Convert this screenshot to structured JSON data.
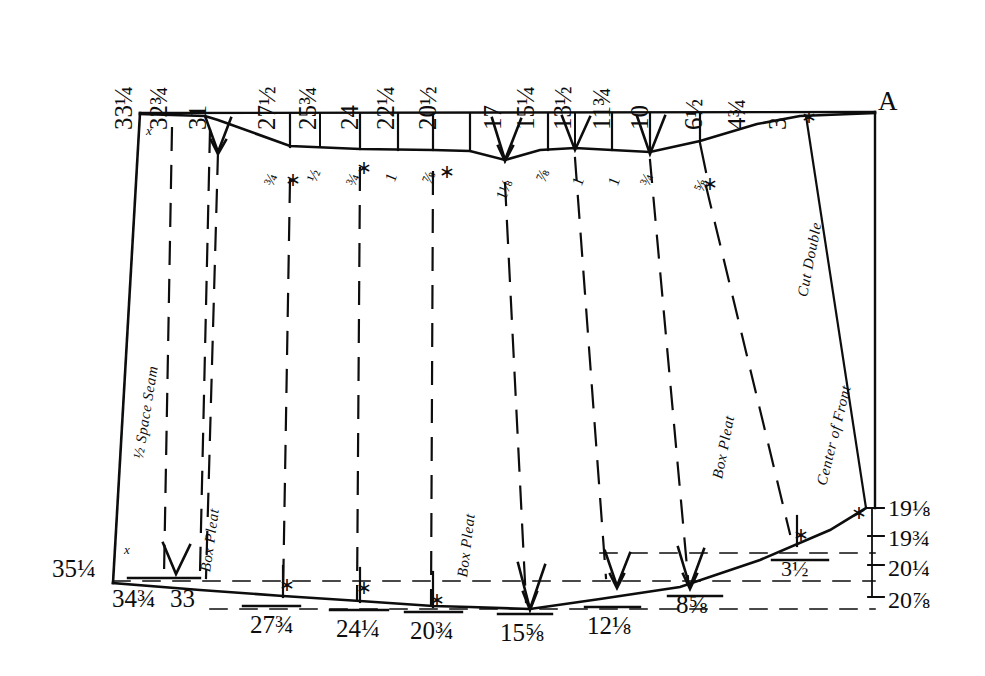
{
  "figure": {
    "kind": "pattern-draft",
    "ink_color": "#0d0d0d",
    "paper_color": "#ffffff",
    "corner_label": "A"
  },
  "top_scale": {
    "note": "Measurement numerals printed vertically above the top edge, read right-to-left descending",
    "items": [
      {
        "text": "33¼",
        "x": 136,
        "size": "lg"
      },
      {
        "text": "32¾",
        "x": 171,
        "size": "lg"
      },
      {
        "text": "31",
        "x": 210,
        "size": "lg"
      },
      {
        "text": "27½",
        "x": 279,
        "size": "lg"
      },
      {
        "text": "25¾",
        "x": 320,
        "size": "lg"
      },
      {
        "text": "24",
        "x": 362,
        "size": "lg"
      },
      {
        "text": "22¼",
        "x": 398,
        "size": "lg"
      },
      {
        "text": "20½",
        "x": 440,
        "size": "lg"
      },
      {
        "text": "17",
        "x": 505,
        "size": "lg"
      },
      {
        "text": "15¼",
        "x": 538,
        "size": "lg"
      },
      {
        "text": "13½",
        "x": 575,
        "size": "lg",
        "stacked": true
      },
      {
        "text": "11¾",
        "x": 614,
        "size": "lg"
      },
      {
        "text": "10",
        "x": 652,
        "size": "lg"
      },
      {
        "text": "6½",
        "x": 706,
        "size": "lg"
      },
      {
        "text": "4¾",
        "x": 749,
        "size": "lg"
      },
      {
        "text": "3",
        "x": 790,
        "size": "lg"
      }
    ]
  },
  "top_sub_scale": {
    "note": "Small drop measurements written at a slant just under the top edge",
    "items": [
      {
        "text": "¾",
        "x": 276,
        "y": 172
      },
      {
        "text": "½",
        "x": 319,
        "y": 168
      },
      {
        "text": "¾",
        "x": 358,
        "y": 172
      },
      {
        "text": "1",
        "x": 397,
        "y": 168
      },
      {
        "text": "⅞",
        "x": 434,
        "y": 170
      },
      {
        "text": "1⅛",
        "x": 508,
        "y": 182
      },
      {
        "text": "⅞",
        "x": 548,
        "y": 168
      },
      {
        "text": "1",
        "x": 584,
        "y": 172
      },
      {
        "text": "1",
        "x": 620,
        "y": 172
      },
      {
        "text": "¾",
        "x": 652,
        "y": 172
      },
      {
        "text": "⅝",
        "x": 706,
        "y": 176
      }
    ]
  },
  "bottom_scale": {
    "items": [
      {
        "text": "35¼",
        "x": 52,
        "y": 560,
        "size": "lg"
      },
      {
        "text": "34¾",
        "x": 112,
        "y": 588,
        "size": "lg"
      },
      {
        "text": "33",
        "x": 168,
        "y": 588,
        "size": "lg"
      },
      {
        "text": "27¾",
        "x": 252,
        "y": 615,
        "size": "lg"
      },
      {
        "text": "24¼",
        "x": 338,
        "y": 615,
        "size": "lg"
      },
      {
        "text": "20¾",
        "x": 412,
        "y": 615,
        "size": "lg"
      },
      {
        "text": "15⅝",
        "x": 504,
        "y": 620,
        "size": "lg"
      },
      {
        "text": "12⅛",
        "x": 589,
        "y": 616,
        "size": "lg"
      },
      {
        "text": "8⅝",
        "x": 678,
        "y": 597,
        "size": "lg"
      },
      {
        "text": "3½",
        "x": 783,
        "y": 566,
        "size": "md"
      }
    ]
  },
  "right_scale": {
    "items": [
      {
        "text": "19⅛",
        "y": 505
      },
      {
        "text": "19¾",
        "y": 536
      },
      {
        "text": "20¼",
        "y": 565
      },
      {
        "text": "20⅞",
        "y": 597
      }
    ]
  },
  "interior_labels": [
    {
      "text": "½ Space Seam",
      "x": 146,
      "y": 445,
      "rot": -81,
      "name": "half-space-seam-label"
    },
    {
      "text": "Box Pleat",
      "x": 213,
      "y": 558,
      "rot": -82,
      "name": "box-pleat-label-left"
    },
    {
      "text": "Box Pleat",
      "x": 470,
      "y": 563,
      "rot": -83,
      "name": "box-pleat-label-center"
    },
    {
      "text": "Box Pleat",
      "x": 725,
      "y": 465,
      "rot": -79,
      "name": "box-pleat-label-right"
    },
    {
      "text": "Center of Front",
      "x": 829,
      "y": 472,
      "rot": -76,
      "name": "center-of-front-label"
    },
    {
      "text": "Cut Double",
      "x": 810,
      "y": 283,
      "rot": -79,
      "name": "cut-double-label"
    }
  ],
  "marks": {
    "asterisk": "∗",
    "x": "x",
    "asterisks": [
      {
        "x": 289,
        "y": 179
      },
      {
        "x": 360,
        "y": 166
      },
      {
        "x": 443,
        "y": 170
      },
      {
        "x": 706,
        "y": 182
      },
      {
        "x": 805,
        "y": 115
      },
      {
        "x": 127,
        "y": 547
      },
      {
        "x": 283,
        "y": 583
      },
      {
        "x": 360,
        "y": 586
      },
      {
        "x": 433,
        "y": 598
      },
      {
        "x": 797,
        "y": 533
      },
      {
        "x": 855,
        "y": 511
      }
    ],
    "x_marks": [
      {
        "x": 148,
        "y": 128
      },
      {
        "x": 126,
        "y": 548
      }
    ]
  }
}
